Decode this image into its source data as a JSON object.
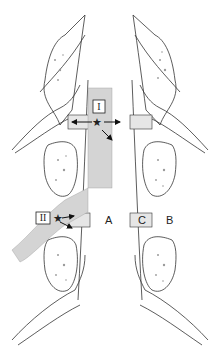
{
  "figure": {
    "type": "anatomical-illustration"
  },
  "labels": {
    "zone_one": "I",
    "zone_two": "II",
    "region_a": "A",
    "region_b": "B",
    "region_c": "C",
    "star": "★"
  },
  "colors": {
    "shaded_zone": "#d4d4d4",
    "facet_band": "#e6e6e6",
    "outline": "#333333",
    "background": "#ffffff",
    "speckle": "#9a9a9a"
  }
}
